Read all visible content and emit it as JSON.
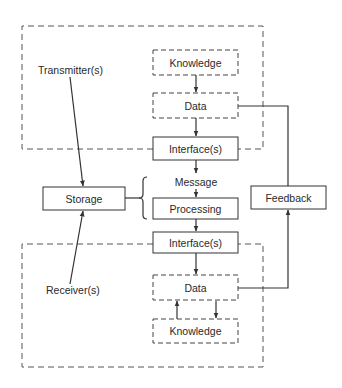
{
  "diagram": {
    "type": "communication-model",
    "labels": {
      "transmitter": "Transmitter(s)",
      "receiver": "Receiver(s)",
      "storage": "Storage",
      "feedback": "Feedback",
      "message": "Message"
    },
    "transmitter_group": {
      "knowledge": "Knowledge",
      "data": "Data",
      "interface": "Interface(s)"
    },
    "channel": {
      "processing": "Processing"
    },
    "receiver_group": {
      "interface": "Interface(s)",
      "data": "Data",
      "knowledge": "Knowledge"
    },
    "edges": [
      {
        "from": "Knowledge (transmitter)",
        "to": "Data (transmitter)"
      },
      {
        "from": "Data (transmitter)",
        "to": "Interface(s) (transmitter)"
      },
      {
        "from": "Interface(s) (transmitter)",
        "to": "Message"
      },
      {
        "from": "Message",
        "to": "Processing"
      },
      {
        "from": "Processing",
        "to": "Interface(s) (receiver)"
      },
      {
        "from": "Interface(s) (receiver)",
        "to": "Data (receiver)"
      },
      {
        "from": "Data (receiver)",
        "to": "Knowledge (receiver)"
      },
      {
        "from": "Knowledge (receiver)",
        "to": "Data (receiver)"
      },
      {
        "from": "Data (receiver)",
        "to": "Feedback"
      },
      {
        "from": "Feedback",
        "to": "Data (transmitter)"
      },
      {
        "from": "Transmitter(s)",
        "to": "Storage"
      },
      {
        "from": "Receiver(s)",
        "to": "Storage"
      },
      {
        "from": "Storage",
        "to": "Message / Processing"
      }
    ]
  }
}
